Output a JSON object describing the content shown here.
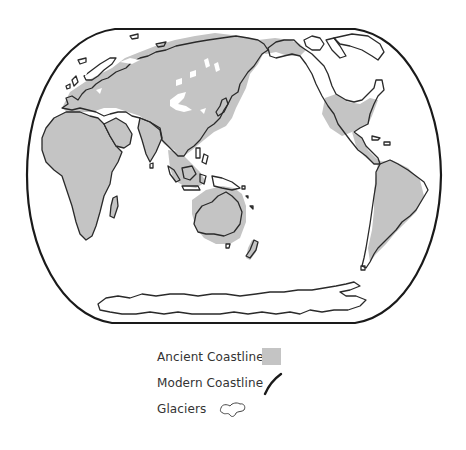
{
  "map": {
    "type": "world-map",
    "projection": "Pacific-centered rounded (Robinson-like)",
    "description": "World map showing ancient (Ice Age) coastlines shaded gray, modern coastlines as black outlines, and glaciers as white blobs",
    "colors": {
      "ancient_coastline_fill": "#c4c4c4",
      "modern_coastline_stroke": "#2a2a2a",
      "frame_stroke": "#1a1a1a",
      "glacier_fill": "#ffffff",
      "background": "#ffffff"
    },
    "regions": [
      "Europe",
      "Asia",
      "Africa",
      "Australia",
      "Southeast Asia",
      "North America",
      "Central America",
      "South America",
      "Antarctica",
      "Greenland"
    ]
  },
  "legend": {
    "items": [
      {
        "label": "Ancient Coastline",
        "symbol": "gray-square-swatch"
      },
      {
        "label": "Modern Coastline",
        "symbol": "black-curved-line"
      },
      {
        "label": "Glaciers",
        "symbol": "white-blob-outline"
      }
    ]
  }
}
